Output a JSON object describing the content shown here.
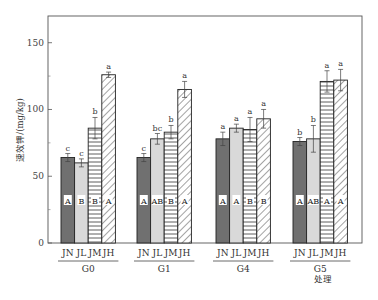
{
  "chart_data": {
    "type": "bar",
    "title": "",
    "xlabel": "处理",
    "ylabel": "速效钾/(mg/kg)",
    "ylim": [
      0,
      170
    ],
    "yticks": [
      0,
      50,
      100,
      150
    ],
    "grid": false,
    "legend": null,
    "groups": [
      "G0",
      "G1",
      "G4",
      "G5"
    ],
    "categories": [
      "JN",
      "JL",
      "JM",
      "JH"
    ],
    "series": [
      {
        "name": "JN",
        "fill": "#707070",
        "pattern": "solid-dark",
        "values": [
          64,
          64,
          78,
          76
        ],
        "errors": [
          3,
          3,
          5,
          3
        ],
        "sig_lower": [
          "c",
          "c",
          "a",
          "b"
        ],
        "sig_upper": [
          "A",
          "A",
          "A",
          "A"
        ]
      },
      {
        "name": "JL",
        "fill": "#d9d9d9",
        "pattern": "solid-light",
        "values": [
          60,
          78,
          86,
          78
        ],
        "errors": [
          3,
          4,
          3,
          10
        ],
        "sig_lower": [
          "c",
          "bc",
          "a",
          "b"
        ],
        "sig_upper": [
          "B",
          "AB",
          "A",
          "AB"
        ]
      },
      {
        "name": "JM",
        "fill": "#ffffff",
        "pattern": "horizontal-lines",
        "values": [
          86,
          83,
          85,
          121
        ],
        "errors": [
          8,
          5,
          9,
          8
        ],
        "sig_lower": [
          "b",
          "b",
          "a",
          "a"
        ],
        "sig_upper": [
          "B",
          "B",
          "B",
          "A"
        ]
      },
      {
        "name": "JH",
        "fill": "#ffffff",
        "pattern": "diagonal-hatch",
        "values": [
          126,
          115,
          93,
          122
        ],
        "errors": [
          2,
          6,
          7,
          8
        ],
        "sig_lower": [
          "a",
          "a",
          "a",
          "a"
        ],
        "sig_upper": [
          "A",
          "A",
          "B",
          "A"
        ]
      }
    ]
  },
  "axes": {
    "y_title": "速效钾/(mg/kg)",
    "x_title": "处理",
    "y_tick_labels": [
      "0",
      "50",
      "100",
      "150"
    ]
  }
}
